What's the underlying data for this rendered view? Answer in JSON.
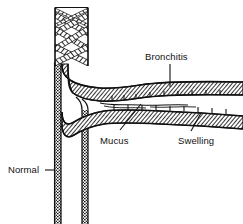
{
  "figure": {
    "background_color": "#ffffff",
    "ink_color": "#111111",
    "style": "black-and-white hatched line art"
  },
  "labels": {
    "bronchitis": "Bronchitis",
    "mucus": "Mucus",
    "swelling": "Swelling",
    "normal": "Normal"
  },
  "structures": {
    "trachea": "vertical airway trunk with crossing fiber bands",
    "upper_branch": "inflamed bronchus upper wall",
    "lower_branch": "inflamed bronchus lower wall",
    "lumen": "narrowed airway passage with mucus"
  }
}
